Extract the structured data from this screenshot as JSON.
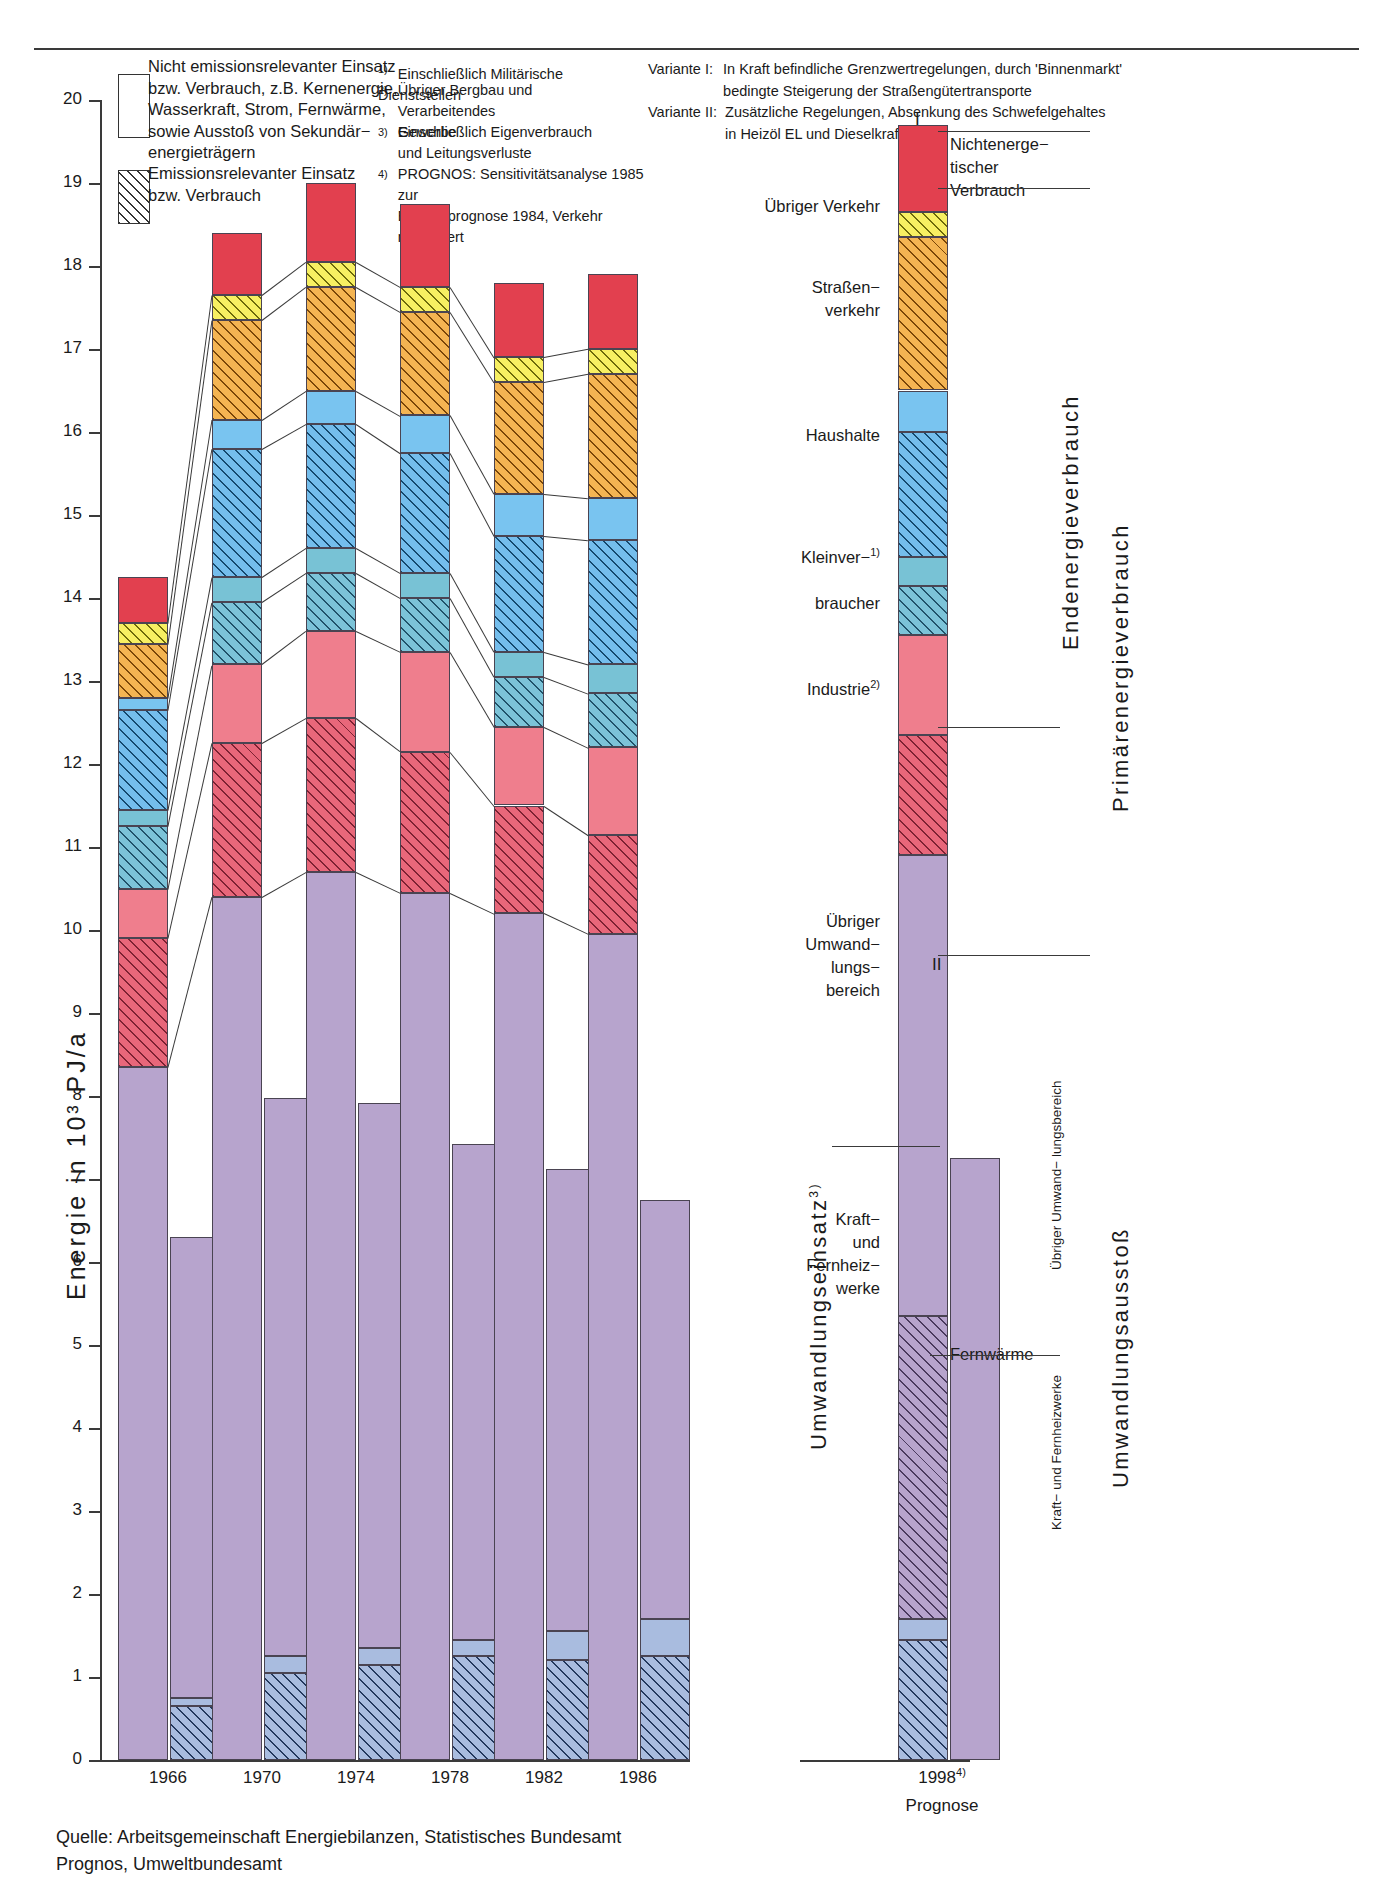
{
  "axis": {
    "y_label": "Energie in 10³ PJ/a",
    "y_ticks": [
      "20",
      "19",
      "18",
      "17",
      "16",
      "15",
      "14",
      "13",
      "12",
      "11",
      "10",
      "9",
      "8",
      "7",
      "6",
      "5",
      "4",
      "3",
      "2",
      "1",
      "0"
    ],
    "y_min": 0,
    "y_max": 20,
    "x_ticks": [
      "1966",
      "1970",
      "1974",
      "1978",
      "1982",
      "1986"
    ],
    "prognose_year": "1998",
    "prognose_sup": "4)",
    "prognose_caption": "Prognose"
  },
  "legend": {
    "item1": "Nicht emissionsrelevanter Einsatz\nbzw. Verbrauch, z.B. Kernenergie,\nWasserkraft, Strom, Fernwärme,\nsowie Ausstoß von Sekundär−\nenergieträgern",
    "item2": "Emissionsrelevanter Einsatz\nbzw. Verbrauch"
  },
  "footnotes": [
    {
      "num": "1)",
      "text": "Einschließlich Militärische Dienststellen"
    },
    {
      "num": "2)",
      "text": "Übriger Bergbau und Verarbeitendes\nGewerbe"
    },
    {
      "num": "3)",
      "text": "Einschließlich Eigenverbrauch\nund Leitungsverluste"
    },
    {
      "num": "4)",
      "text": "PROGNOS: Sensitivitätsanalyse 1985 zur\nEnergieprognose 1984, Verkehr modifiziert"
    }
  ],
  "variants": [
    {
      "label": "Variante I:",
      "text": "In Kraft befindliche Grenzwertregelungen, durch 'Binnenmarkt'\nbedingte Steigerung der Straßengütertransporte"
    },
    {
      "label": "Variante II:",
      "text": "Zusätzliche Regelungen, Absenkung des Schwefelgehaltes\nin Heizöl EL und Dieselkraftstoff"
    }
  ],
  "segment_labels": {
    "nichtenergetisch": "Nichtenerge−\ntischer\nVerbrauch",
    "uebriger_verkehr": "Übriger Verkehr",
    "strassenverkehr": "Straßen−\nverkehr",
    "haushalte": "Haushalte",
    "kleinverbraucher": "Kleinver−",
    "kleinverbraucher_sup": "1)",
    "kleinverbraucher2": "braucher",
    "industrie": "Industrie",
    "industrie_sup": "2)",
    "uebriger_umwandlung": "Übriger\nUmwand−\nlungs−\nbereich",
    "kraft_fernheiz": "Kraft−\nund\nFernheiz−\nwerke",
    "fernwaerme": "Fernwärme"
  },
  "vertical_labels": {
    "umwandlungseinsatz": "Umwandlungseinsatz",
    "umwandlungseinsatz_sup": "3)",
    "endenergieverbrauch": "Endenergieverbrauch",
    "primaerenergieverbrauch": "Primärenergieverbrauch",
    "umwandlungsausstoss": "Umwandlungsausstoß",
    "uebriger_umwandlungsbereich": "Übriger Umwand−\nlungsbereich",
    "kraft_fernheizwerke": "Kraft− und\nFernheizwerke"
  },
  "roman": {
    "one": "I",
    "two": "II"
  },
  "source": "Quelle:  Arbeitsgemeinschaft Energiebilanzen, Statistisches Bundesamt\n            Prognos, Umweltbundesamt",
  "colors": {
    "crimson": "#e2404f",
    "yellow": "#f7ef62",
    "orange": "#f4b452",
    "lightblue": "#79c4f0",
    "teal": "#78c2d5",
    "pink": "#ef7e8d",
    "lavender": "#b7a4cd",
    "steel": "#a9bcdf"
  },
  "chart_data": {
    "type": "bar",
    "title": "",
    "xlabel": "",
    "ylabel": "Energie in 10³ PJ/a",
    "ylim": [
      0,
      20
    ],
    "grid": false,
    "legend": [
      "Nicht emissionsrelevanter Einsatz bzw. Verbrauch",
      "Emissionsrelevanter Einsatz bzw. Verbrauch"
    ],
    "note": "Stacked dual bars per year: left bar = Primärenergieverbrauch / Endenergieverbrauch stack, right bar = Umwandlungsausstoß stack. Values in 10³ PJ/a, cumulative tops read off the axis.",
    "categories": [
      "1966",
      "1970",
      "1974",
      "1978",
      "1982",
      "1986",
      "1998 I",
      "1998 II"
    ],
    "left_bar_tops": [
      14.25,
      17.95,
      18.8,
      18.95,
      17.85,
      18.25,
      19.25,
      null
    ],
    "right_bar_tops": [
      6.3,
      7.97,
      7.92,
      7.42,
      7.12,
      6.75,
      null,
      7.25
    ],
    "series": [
      {
        "name": "Umwandlungseinsatz (übriger Umwandlungsbereich, nicht emissionsrelevant)",
        "color": "#b7a4cd",
        "pattern": "solid",
        "values": [
          8.35,
          10.4,
          10.7,
          10.45,
          10.2,
          9.95,
          10.9,
          null
        ]
      },
      {
        "name": "Industrie emissionsrelevant",
        "color": "#ef7e8d",
        "pattern": "hatched",
        "values": [
          1.55,
          1.85,
          1.85,
          1.7,
          1.3,
          1.2,
          1.45,
          null
        ]
      },
      {
        "name": "Industrie nicht emissionsrelevant",
        "color": "#ef7e8d",
        "pattern": "solid",
        "values": [
          0.6,
          0.95,
          1.05,
          1.2,
          0.95,
          1.05,
          1.2,
          null
        ]
      },
      {
        "name": "Kleinverbraucher emissionsrelevant",
        "color": "#78c2d5",
        "pattern": "hatched",
        "values": [
          0.75,
          0.75,
          0.7,
          0.65,
          0.6,
          0.65,
          0.6,
          null
        ]
      },
      {
        "name": "Kleinverbraucher nicht emissionsrelevant",
        "color": "#78c2d5",
        "pattern": "solid",
        "values": [
          0.2,
          0.3,
          0.3,
          0.3,
          0.3,
          0.35,
          0.35,
          null
        ]
      },
      {
        "name": "Haushalte emissionsrelevant",
        "color": "#79c4f0",
        "pattern": "hatched",
        "values": [
          1.2,
          1.55,
          1.5,
          1.45,
          1.4,
          1.5,
          1.5,
          null
        ]
      },
      {
        "name": "Haushalte nicht emissionsrelevant",
        "color": "#79c4f0",
        "pattern": "solid",
        "values": [
          0.15,
          0.35,
          0.4,
          0.45,
          0.5,
          0.5,
          0.5,
          null
        ]
      },
      {
        "name": "Straßenverkehr emissionsrelevant",
        "color": "#f4b452",
        "pattern": "hatched",
        "values": [
          0.65,
          1.2,
          1.25,
          1.25,
          1.35,
          1.5,
          1.85,
          null
        ]
      },
      {
        "name": "Übriger Verkehr emissionsrelevant",
        "color": "#f7ef62",
        "pattern": "hatched",
        "values": [
          0.25,
          0.3,
          0.3,
          0.3,
          0.3,
          0.3,
          0.3,
          null
        ]
      },
      {
        "name": "Nichtenergetischer Verbrauch",
        "color": "#e2404f",
        "pattern": "solid",
        "values": [
          0.55,
          0.75,
          0.95,
          1.0,
          0.9,
          0.9,
          1.05,
          null
        ]
      }
    ],
    "right_bar_series": [
      {
        "name": "Kraft- und Fernheizwerke emissionsrelevant",
        "color": "#a9bcdf",
        "pattern": "hatched",
        "values": [
          0.65,
          1.05,
          1.15,
          1.25,
          1.2,
          1.25,
          null,
          1.7
        ]
      },
      {
        "name": "Fernwärme nicht emissionsrelevant",
        "color": "#a9bcdf",
        "pattern": "solid",
        "values": [
          0.1,
          0.2,
          0.2,
          0.2,
          0.35,
          0.45,
          null,
          0.25
        ]
      },
      {
        "name": "Übriger Umwandlungsbereich",
        "color": "#b7a4cd",
        "pattern": "solid",
        "values": [
          5.55,
          6.72,
          6.57,
          5.97,
          5.57,
          5.05,
          null,
          5.3
        ]
      }
    ]
  }
}
